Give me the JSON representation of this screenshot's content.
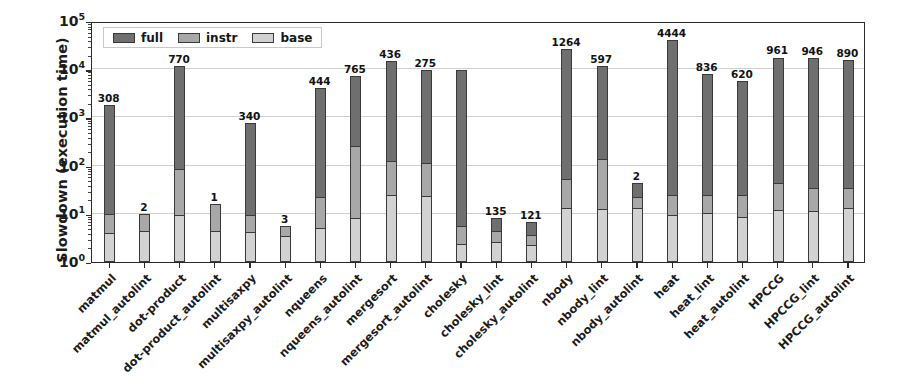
{
  "chart_data": {
    "type": "bar",
    "subtype": "stacked-bar",
    "title": "",
    "xlabel": "",
    "ylabel": "Slowdown (execution time)",
    "yscale": "log",
    "ylim": [
      1,
      100000
    ],
    "ytick_labels": [
      "10^0",
      "10^1",
      "10^2",
      "10^3",
      "10^4",
      "10^5"
    ],
    "ytick_values": [
      1,
      10,
      100,
      1000,
      10000,
      100000
    ],
    "grid": true,
    "legend_position": "upper left",
    "legend": [
      "full",
      "instr",
      "base"
    ],
    "categories": [
      "matmul",
      "matmul_autolint",
      "dot-product",
      "dot-product_autolint",
      "multisaxpy",
      "multisaxpy_autolint",
      "nqueens",
      "nqueens_autolint",
      "mergesort",
      "mergesort_autolint",
      "cholesky",
      "cholesky_lint",
      "cholesky_autolint",
      "nbody",
      "nbody_lint",
      "nbody_autolint",
      "heat",
      "heat_lint",
      "heat_autolint",
      "HPCCG",
      "HPCCG_lint",
      "HPCCG_autolint"
    ],
    "series": [
      {
        "name": "base",
        "values": [
          4.0,
          4.4,
          9.3,
          4.5,
          4.2,
          3.4,
          5.2,
          8.0,
          24.0,
          23.0,
          2.4,
          2.6,
          2.3,
          13.0,
          12.5,
          13.0,
          9.6,
          10.5,
          8.6,
          12.0,
          11.5,
          13.5
        ]
      },
      {
        "name": "instr",
        "values": [
          9.8,
          10.0,
          86.0,
          16.0,
          9.5,
          5.5,
          22.0,
          250.0,
          126.0,
          115.0,
          5.5,
          4.3,
          3.6,
          52.0,
          140.0,
          22.0,
          24.0,
          24.0,
          24.0,
          43.0,
          34.0,
          34.0
        ]
      },
      {
        "name": "full",
        "values": [
          1800.0,
          10.0,
          11500.0,
          16.0,
          780.0,
          5.5,
          4100.0,
          7400.0,
          15000.0,
          9800.0,
          9600.0,
          8.0,
          6.8,
          26000.0,
          11800.0,
          44.0,
          40000.0,
          8000.0,
          5600.0,
          17500.0,
          17000.0,
          15500.0
        ]
      }
    ],
    "bar_labels": [
      "308",
      "2",
      "770",
      "1",
      "340",
      "3",
      "444",
      "765",
      "436",
      "275",
      "",
      "135",
      "121",
      "1264",
      "597",
      "2",
      "4444",
      "836",
      "620",
      "961",
      "946",
      "890"
    ],
    "colors": {
      "full": "#6f6f6f",
      "instr": "#a8a8a8",
      "base": "#d2d2d2",
      "edge": "#3a3a3a",
      "grid": "#d0cfcf",
      "axis": "#2b2b2b",
      "text": "#1b1b1b",
      "background": "#ffffff"
    }
  }
}
